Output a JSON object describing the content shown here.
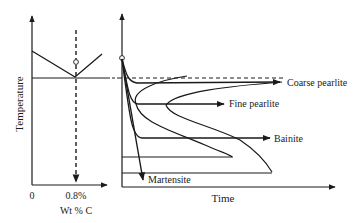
{
  "left_plot": {
    "y_label": "Temperature",
    "x_label": "Wt % C",
    "x_ticks": [
      "0",
      "0.8%"
    ]
  },
  "right_plot": {
    "x_label": "Time",
    "products": {
      "coarse": "Coarse pearlite",
      "fine": "Fine pearlite",
      "bainite": "Bainite",
      "martensite": "Martensite"
    }
  },
  "colors": {
    "ink": "#1a1a1a",
    "background": "#ffffff"
  }
}
